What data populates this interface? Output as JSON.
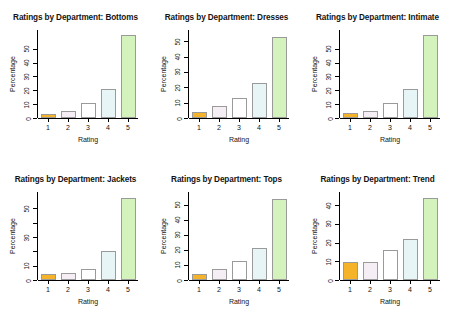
{
  "figure": {
    "background": "#ffffff",
    "layout": "2 rows x 3 columns",
    "axis_label_x": "Rating",
    "axis_label_y": "Percentage",
    "bar_palette": [
      "#f5b32a",
      "#f5eff5",
      "#ffffff",
      "#e8f5f7",
      "#d4f2bc"
    ],
    "bar_border_color": "#9a9a9a",
    "axis_color": "#000000"
  },
  "chart_data": [
    {
      "type": "bar",
      "title": "Ratings by Department: Bottoms",
      "xlabel": "Rating",
      "ylabel": "Percentage",
      "categories": [
        "1",
        "2",
        "3",
        "4",
        "5"
      ],
      "values": [
        3,
        5,
        10.5,
        21,
        60
      ],
      "ylim": [
        0,
        62
      ],
      "yticks": [
        0,
        10,
        20,
        30,
        40,
        50
      ],
      "ytick_labels": [
        "0",
        "10",
        "20",
        "30",
        "40",
        "50"
      ],
      "grid": false,
      "legend": "none"
    },
    {
      "type": "bar",
      "title": "Ratings by Department: Dresses",
      "xlabel": "Rating",
      "ylabel": "Percentage",
      "categories": [
        "1",
        "2",
        "3",
        "4",
        "5"
      ],
      "values": [
        4,
        7.5,
        13,
        22.5,
        53
      ],
      "ylim": [
        0,
        56
      ],
      "yticks": [
        0,
        10,
        20,
        30,
        40,
        50
      ],
      "ytick_labels": [
        "0",
        "10",
        "20",
        "30",
        "40",
        "50"
      ],
      "grid": false,
      "legend": "none"
    },
    {
      "type": "bar",
      "title": "Ratings by Department: Intimate",
      "xlabel": "Rating",
      "ylabel": "Percentage",
      "categories": [
        "1",
        "2",
        "3",
        "4",
        "5"
      ],
      "values": [
        3.5,
        5,
        10.5,
        21,
        60
      ],
      "ylim": [
        0,
        62
      ],
      "yticks": [
        0,
        10,
        20,
        30,
        40,
        50
      ],
      "ytick_labels": [
        "0",
        "10",
        "20",
        "30",
        "40",
        "50"
      ],
      "grid": false,
      "legend": "none"
    },
    {
      "type": "bar",
      "title": "Ratings by Department: Jackets",
      "xlabel": "Rating",
      "ylabel": "Percentage",
      "categories": [
        "1",
        "2",
        "3",
        "4",
        "5"
      ],
      "values": [
        4,
        5,
        8,
        20,
        57
      ],
      "ylim": [
        0,
        60
      ],
      "yticks": [
        0,
        10,
        20,
        30,
        40,
        50
      ],
      "ytick_labels": [
        "0",
        "10",
        "",
        "30",
        "",
        "50"
      ],
      "grid": false,
      "legend": "none"
    },
    {
      "type": "bar",
      "title": "Ratings by Department: Tops",
      "xlabel": "Rating",
      "ylabel": "Percentage",
      "categories": [
        "1",
        "2",
        "3",
        "4",
        "5"
      ],
      "values": [
        4,
        7,
        12.5,
        21.5,
        54
      ],
      "ylim": [
        0,
        57
      ],
      "yticks": [
        0,
        10,
        20,
        30,
        40,
        50
      ],
      "ytick_labels": [
        "0",
        "10",
        "20",
        "30",
        "40",
        "50"
      ],
      "grid": false,
      "legend": "none"
    },
    {
      "type": "bar",
      "title": "Ratings by Department: Trend",
      "xlabel": "Rating",
      "ylabel": "Percentage",
      "categories": [
        "1",
        "2",
        "3",
        "4",
        "5"
      ],
      "values": [
        9.5,
        9.5,
        16,
        22,
        44
      ],
      "ylim": [
        0,
        46
      ],
      "yticks": [
        0,
        10,
        20,
        30,
        40
      ],
      "ytick_labels": [
        "0",
        "10",
        "20",
        "30",
        "40"
      ],
      "grid": false,
      "legend": "none"
    }
  ]
}
